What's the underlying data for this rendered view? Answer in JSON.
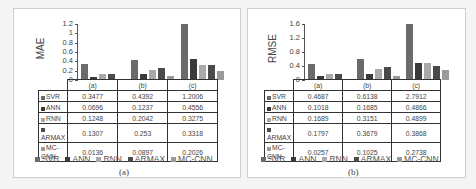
{
  "chart_data": [
    {
      "type": "bar",
      "panel": "(a)",
      "ylabel": "MAE",
      "categories": [
        "(a)",
        "(b)",
        "(c)"
      ],
      "yticks": [
        "1.2",
        "1",
        "0.8",
        "0.6",
        "0.4",
        "0.2",
        "0"
      ],
      "ylim": [
        0,
        1.2
      ],
      "series": [
        {
          "name": "SVR",
          "values": [
            0.3477,
            0.4392,
            1.2006
          ],
          "labels": [
            "0.3477",
            "0.4392",
            "1.2006"
          ]
        },
        {
          "name": "ANN",
          "values": [
            0.0696,
            0.1237,
            0.4556
          ],
          "labels": [
            "0.0696",
            "0.1237",
            "0.4556"
          ]
        },
        {
          "name": "RNN",
          "values": [
            0.1248,
            0.2042,
            0.3275
          ],
          "labels": [
            "0.1248",
            "0.2042",
            "0.3275"
          ]
        },
        {
          "name": "ARMAX",
          "values": [
            0.1307,
            0.253,
            0.3318
          ],
          "labels": [
            "0.1307",
            "0.253",
            "0.3318"
          ]
        },
        {
          "name": "MC-CNN",
          "values": [
            0.0136,
            0.0897,
            0.2026
          ],
          "labels": [
            "0.0136",
            "0.0897",
            "0.2026"
          ]
        }
      ],
      "legend_position": "bottom",
      "grid": false,
      "caption": "(a)"
    },
    {
      "type": "bar",
      "panel": "(b)",
      "ylabel": "RMSE",
      "categories": [
        "(a)",
        "(b)",
        "(c)"
      ],
      "yticks": [
        "1.6",
        "1.2",
        "0.8",
        "0.4",
        "0"
      ],
      "ylim": [
        0,
        1.6
      ],
      "series": [
        {
          "name": "SVR",
          "values": [
            0.4687,
            0.6138,
            2.7912
          ],
          "labels": [
            "0.4687",
            "0.6138",
            "2.7912"
          ]
        },
        {
          "name": "ANN",
          "values": [
            0.1018,
            0.1685,
            0.4866
          ],
          "labels": [
            "0.1018",
            "0.1685",
            "0.4866"
          ]
        },
        {
          "name": "RNN",
          "values": [
            0.1689,
            0.3151,
            0.4899
          ],
          "labels": [
            "0.1689",
            "0.3151",
            "0.4899"
          ]
        },
        {
          "name": "ARMAX",
          "values": [
            0.1797,
            0.3679,
            0.3868
          ],
          "labels": [
            "0.1797",
            "0.3679",
            "0.3868"
          ]
        },
        {
          "name": "MC-CNN",
          "values": [
            0.0257,
            0.1025,
            0.2738
          ],
          "labels": [
            "0.0257",
            "0.1025",
            "0.2738"
          ]
        }
      ],
      "legend_position": "bottom",
      "grid": false,
      "caption": "(b)"
    }
  ],
  "colors": {
    "SVR": "#6b6b6b",
    "ANN": "#3a3a3a",
    "RNN": "#a9a9a9",
    "ARMAX": "#4a4a4a",
    "MC-CNN": "#9a9a9a"
  }
}
